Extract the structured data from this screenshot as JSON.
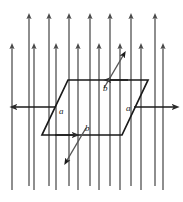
{
  "figure": {
    "name": "current-loop-in-magnetic-field",
    "background": "#ffffff",
    "field_color": "#4a4a4a",
    "loop_color": "#1a1a1a",
    "label_color": "#1a1a1a",
    "width": 183,
    "height": 202
  },
  "field": {
    "name": "uniform-magnetic-field",
    "direction": "up",
    "arrow_color": "#4a4a4a",
    "tall_arrows": [
      {
        "x": 29,
        "y_tip": 14,
        "y_tail": 186
      },
      {
        "x": 49,
        "y_tip": 14,
        "y_tail": 186
      },
      {
        "x": 69,
        "y_tip": 14,
        "y_tail": 186
      },
      {
        "x": 90,
        "y_tip": 14,
        "y_tail": 186
      },
      {
        "x": 110,
        "y_tip": 14,
        "y_tail": 186
      },
      {
        "x": 131,
        "y_tip": 14,
        "y_tail": 186
      },
      {
        "x": 155,
        "y_tip": 14,
        "y_tail": 186
      }
    ],
    "short_arrows": [
      {
        "x": 12,
        "y_tip": 44,
        "y_tail": 190
      },
      {
        "x": 34,
        "y_tip": 44,
        "y_tail": 190
      },
      {
        "x": 56,
        "y_tip": 44,
        "y_tail": 190
      },
      {
        "x": 78,
        "y_tip": 44,
        "y_tail": 190
      },
      {
        "x": 99,
        "y_tip": 44,
        "y_tail": 190
      },
      {
        "x": 120,
        "y_tip": 44,
        "y_tail": 190
      },
      {
        "x": 141,
        "y_tip": 44,
        "y_tail": 190
      },
      {
        "x": 163,
        "y_tip": 44,
        "y_tail": 190
      }
    ]
  },
  "loop": {
    "name": "parallelogram-current-loop",
    "points": "68,80 148,80 122,135 42,135",
    "stroke": "#1a1a1a",
    "stroke_width": 1.6
  },
  "labels": {
    "side_a_left": "a",
    "side_a_right": "a",
    "side_b_top": "b",
    "side_b_bottom": "b"
  },
  "current_arrows": {
    "top_edge": {
      "name": "top-edge-current-arrow",
      "direction": "left"
    },
    "bottom_edge": {
      "name": "bottom-edge-current-arrow",
      "direction": "right"
    },
    "left_force": {
      "name": "left-force-arrow",
      "direction": "left"
    },
    "right_force": {
      "name": "right-force-arrow",
      "direction": "right"
    },
    "upper_slant": {
      "name": "upper-slant-current-arrow",
      "direction": "up-right"
    },
    "lower_slant": {
      "name": "lower-slant-current-arrow",
      "direction": "down-left"
    }
  }
}
